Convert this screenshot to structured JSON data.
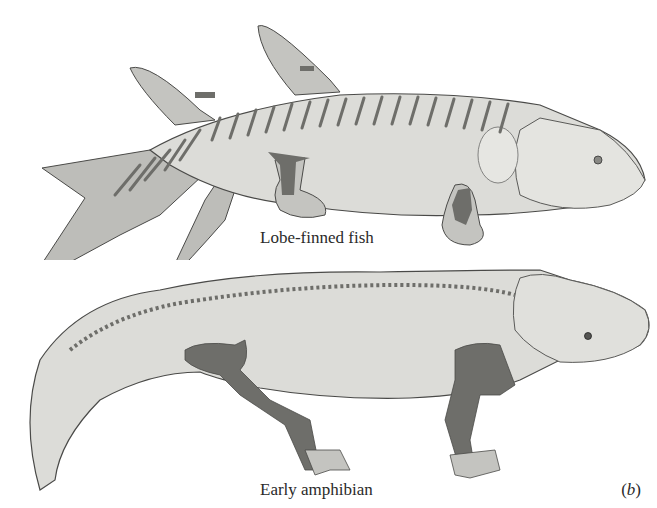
{
  "figure": {
    "panel_label_open": "(",
    "panel_label_letter": "b",
    "panel_label_close": ")",
    "illustrations": [
      {
        "id": "lobe-finned-fish",
        "caption": "Lobe-finned fish"
      },
      {
        "id": "early-amphibian",
        "caption": "Early amphibian"
      }
    ],
    "colors": {
      "body_fill": "#dcdcd8",
      "fin_fill": "#bdbdb9",
      "bone_fill": "#6e6e6a",
      "outline": "#4a4a48",
      "background": "#ffffff"
    }
  }
}
